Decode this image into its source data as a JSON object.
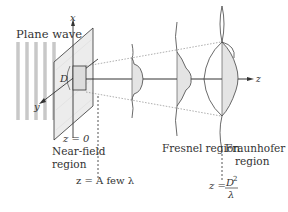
{
  "labels": {
    "plane_wave": "Plane wave",
    "axis_x": "x",
    "axis_y": "y",
    "axis_z": "z",
    "aperture_size": "D",
    "z_zero": "z = 0",
    "near_field_line1": "Near-field",
    "near_field_line2": "region",
    "z_few_lambda": "z = A few λ",
    "fresnel": "Fresnel region",
    "fraunhofer_line1": "Fraunhofer",
    "fraunhofer_line2": "region",
    "z_far_prefix": "z = ",
    "z_far_numerator": "D",
    "z_far_numerator_exp": "2",
    "z_far_denominator": "λ"
  },
  "colors": {
    "line": "#333333",
    "fill": "#e4e4e4",
    "plane_fill": "#ececec",
    "wave_stripes": "#c8c8c8",
    "dotted": "#666666"
  }
}
